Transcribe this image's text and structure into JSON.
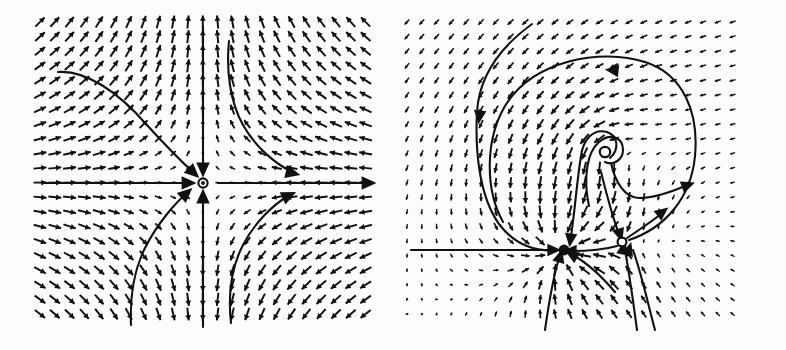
{
  "figure": {
    "background_color": "#fdfdfd",
    "ink_color": "#111111",
    "width": 786,
    "height": 350,
    "panel_count": 2,
    "caption": ""
  },
  "chart_data": [
    {
      "type": "scatter",
      "subtype": "vector-field-phase-portrait",
      "title": "Saddle point phase portrait",
      "xlabel": "",
      "ylabel": "",
      "xlim": [
        -1,
        1
      ],
      "ylim": [
        -1,
        1
      ],
      "grid": false,
      "legend": "none",
      "tick_labels": [],
      "annotations": [],
      "field": {
        "description": "Linear saddle: x' = -x, y' = y with arrows scaled by magnitude",
        "glyph": "arrow",
        "grid_cols": 23,
        "grid_rows": 21,
        "x_start": 40,
        "y_start": 22,
        "spacing_x": 14.8,
        "spacing_y": 14.6,
        "max_arrow_length": 13,
        "origin_px": [
          203,
          183
        ],
        "scale_px": 168
      },
      "fixed_points": [
        {
          "name": "saddle",
          "marker": "open-ring",
          "x_px": 203,
          "y_px": 183,
          "radius": 4.6
        }
      ],
      "trajectories": [
        {
          "name": "stable-manifold-upper-left",
          "path": "M 58 72 C 86 70 118 92 146 124 C 166 146 184 164 196 175",
          "arrow_at": [
            196,
            175
          ],
          "arrow_angle": 43
        },
        {
          "name": "stable-manifold-lower-left",
          "path": "M 131 325 C 130 300 133 272 145 248 C 157 224 175 203 189 191",
          "arrow_at": [
            189,
            191
          ],
          "arrow_angle": -42
        },
        {
          "name": "unstable-manifold-upper-right",
          "path": "M 229 41 C 226 70 230 102 243 125 C 256 148 276 164 292 172",
          "arrow_at": [
            296,
            174
          ],
          "arrow_angle": 14
        },
        {
          "name": "unstable-manifold-lower-right",
          "path": "M 231 323 C 228 296 231 268 243 245 C 255 222 273 205 288 196",
          "arrow_at": [
            292,
            194
          ],
          "arrow_angle": -25
        },
        {
          "name": "stable-axis-left",
          "path": "M 42 183 L 192 183",
          "arrow_at": [
            192,
            183
          ],
          "arrow_angle": 0
        },
        {
          "name": "unstable-axis-right",
          "path": "M 218 183 L 372 183",
          "arrow_at": [
            372,
            183
          ],
          "arrow_angle": 0
        },
        {
          "name": "stable-axis-top",
          "path": "M 203 26 L 203 173",
          "arrow_at": [
            203,
            173
          ],
          "arrow_angle": 90
        },
        {
          "name": "stable-axis-bottom",
          "path": "M 203 327 L 203 193",
          "arrow_at": [
            203,
            193
          ],
          "arrow_angle": -90
        }
      ]
    },
    {
      "type": "scatter",
      "subtype": "vector-field-phase-portrait",
      "title": "Phase portrait with stable node, saddle and unstable spiral",
      "xlabel": "",
      "ylabel": "",
      "xlim": [
        -1,
        1
      ],
      "ylim": [
        -1,
        1
      ],
      "grid": false,
      "legend": "none",
      "tick_labels": [],
      "annotations": [],
      "field": {
        "description": "Nonlinear field with three equilibria and a large homoclinic-like loop",
        "glyph": "arrow",
        "grid_cols": 23,
        "grid_rows": 21,
        "x_start": 14,
        "y_start": 22,
        "spacing_x": 14.8,
        "spacing_y": 14.6,
        "max_arrow_length": 13
      },
      "fixed_points": [
        {
          "name": "stable-node",
          "marker": "filled-dot",
          "x_px": 171,
          "y_px": 250,
          "radius": 5.4
        },
        {
          "name": "saddle",
          "marker": "open-ring",
          "x_px": 229,
          "y_px": 242,
          "radius": 4.4
        },
        {
          "name": "unstable-spiral",
          "marker": "open-ring",
          "x_px": 212,
          "y_px": 152,
          "radius": 5.2
        }
      ],
      "trajectories": [
        {
          "name": "outer-loop",
          "path": "M 139 24 C 106 48 86 78 84 112 C 82 150 86 196 106 224 C 124 248 146 252 166 250",
          "arrow_at": [
            86,
            120
          ],
          "arrow_angle": 97
        },
        {
          "name": "outer-loop-return",
          "path": "M 110 222 C 92 190 92 140 112 106 C 140 60 208 48 252 62 C 290 74 306 112 302 156 C 298 198 272 228 236 240",
          "arrow_at": [
            216,
            70
          ],
          "arrow_angle": 186
        },
        {
          "name": "spiral-in-tail",
          "path": "M 217 158 C 226 150 226 136 214 132 C 200 128 190 140 188 156 C 184 180 182 210 178 236",
          "arrow_at": [
            177,
            243
          ],
          "arrow_angle": 97
        },
        {
          "name": "spiral-out-right",
          "path": "M 218 163 C 222 182 232 198 246 198 C 262 198 278 192 292 186",
          "arrow_at": [
            298,
            184
          ],
          "arrow_angle": -20
        },
        {
          "name": "saddle-stable-from-spiral",
          "path": "M 208 172 C 214 196 220 218 226 234",
          "arrow_at": [
            228,
            238
          ],
          "arrow_angle": 72
        },
        {
          "name": "saddle-unstable-to-node",
          "path": "M 224 246 C 210 250 192 251 178 251",
          "arrow_at": [
            174,
            251
          ],
          "arrow_angle": 180
        },
        {
          "name": "saddle-unstable-upper-right",
          "path": "M 234 238 C 246 230 258 222 268 214",
          "arrow_at": [
            272,
            210
          ],
          "arrow_angle": -38
        },
        {
          "name": "saddle-stable-from-below",
          "path": "M 244 330 C 240 300 236 272 232 250",
          "arrow_at": [
            231,
            245
          ],
          "arrow_angle": -80
        },
        {
          "name": "node-inflow-left",
          "path": "M 18 250 L 164 250",
          "arrow_at": [
            164,
            250
          ],
          "arrow_angle": 0
        },
        {
          "name": "node-inflow-below",
          "path": "M 152 330 C 156 302 160 278 166 258",
          "arrow_at": [
            168,
            253
          ],
          "arrow_angle": -74
        },
        {
          "name": "node-inflow-lower-right",
          "path": "M 222 292 C 210 278 196 264 180 255",
          "arrow_at": [
            176,
            253
          ],
          "arrow_angle": -150
        },
        {
          "name": "node-inflow-right-lower",
          "path": "M 262 330 C 254 300 248 272 240 250",
          "arrow_at": [
            237,
            246
          ],
          "arrow_angle": -72
        }
      ]
    }
  ]
}
